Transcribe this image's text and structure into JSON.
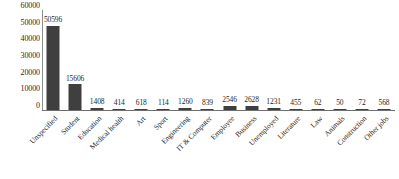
{
  "chart_data": {
    "type": "bar",
    "title": "",
    "subtitle": "",
    "xlabel": "",
    "ylabel": "",
    "ylim": [
      0,
      60000
    ],
    "grid": false,
    "legend": null,
    "bar_color": "#3f3f3f",
    "axis_color": "#6f6f6f",
    "y_ticks": [
      "0",
      "10000",
      "20000",
      "30000",
      "40000",
      "50000",
      "60000"
    ],
    "y_tick_values": [
      0,
      10000,
      20000,
      30000,
      40000,
      50000,
      60000
    ],
    "categories": [
      "Unspecified",
      "Student",
      "Education",
      "Medical health",
      "Art",
      "Sport",
      "Engineering",
      "IT & Computer",
      "Employee",
      "Business",
      "Unemployed",
      "Literature",
      "Law",
      "Animals",
      "Construction",
      "Other jobs"
    ],
    "values": [
      50596,
      15606,
      1408,
      414,
      618,
      114,
      1260,
      839,
      2546,
      2628,
      1231,
      455,
      62,
      50,
      72,
      568
    ],
    "value_labels": [
      "50596",
      "15606",
      "1408",
      "414",
      "618",
      "114",
      "1260",
      "839",
      "2546",
      "2628",
      "1231",
      "455",
      "62",
      "50",
      "72",
      "568"
    ]
  }
}
